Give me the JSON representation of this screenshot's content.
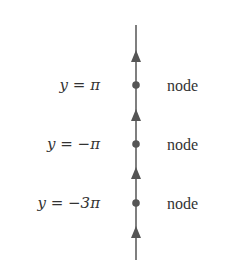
{
  "diagram": {
    "line_color": "#555555",
    "axis": {
      "x": 136,
      "y_top": 25,
      "y_bottom": 260
    },
    "arrows": [
      {
        "y": 58,
        "direction": "up"
      },
      {
        "y": 117,
        "direction": "up"
      },
      {
        "y": 175,
        "direction": "up"
      },
      {
        "y": 234,
        "direction": "up"
      }
    ],
    "points": [
      {
        "y": 85,
        "var": "y",
        "eq": " = ",
        "value": "π",
        "type": "node"
      },
      {
        "y": 144,
        "var": "y",
        "eq": " = ",
        "value": "−π",
        "type": "node"
      },
      {
        "y": 203,
        "var": "y",
        "eq": " = ",
        "value": "−3π",
        "type": "node"
      }
    ]
  }
}
